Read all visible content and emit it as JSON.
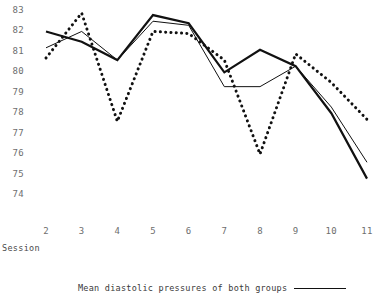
{
  "chart_data": {
    "type": "line",
    "title": "",
    "xlabel": "Session",
    "ylabel": "",
    "categories": [
      2,
      3,
      4,
      5,
      6,
      7,
      8,
      9,
      10,
      11
    ],
    "x": [
      2,
      3,
      4,
      5,
      6,
      7,
      8,
      9,
      10,
      11
    ],
    "xlim": [
      2,
      11
    ],
    "ylim": [
      74,
      83
    ],
    "yticks": [
      83,
      82,
      81,
      80,
      79,
      78,
      77,
      76,
      75,
      74
    ],
    "xticks": [
      2,
      3,
      4,
      5,
      6,
      7,
      8,
      9,
      10,
      11
    ],
    "grid": false,
    "legend_position": "bottom",
    "series": [
      {
        "name": "Mean diastolic pressures of both groups",
        "style": "solid-thick",
        "values": [
          82.0,
          81.5,
          80.6,
          82.8,
          82.4,
          80.0,
          81.1,
          80.3,
          78.0,
          74.8
        ]
      },
      {
        "name": "group-b-solid-thin",
        "style": "solid-thin",
        "values": [
          81.2,
          82.0,
          80.6,
          82.5,
          82.3,
          79.3,
          79.3,
          80.3,
          78.3,
          75.6
        ]
      },
      {
        "name": "group-c-dotted",
        "style": "dotted",
        "values": [
          80.7,
          82.9,
          77.6,
          82.0,
          81.9,
          80.6,
          76.0,
          80.9,
          79.5,
          77.7
        ]
      }
    ]
  },
  "axes": {
    "y_tick_labels": [
      "83",
      "82",
      "81",
      "80",
      "79",
      "78",
      "77",
      "76",
      "75",
      "74"
    ],
    "x_tick_labels": [
      "2",
      "3",
      "4",
      "5",
      "6",
      "7",
      "8",
      "9",
      "10",
      "11"
    ],
    "x_axis_title": "Session"
  },
  "legend": {
    "entries": [
      {
        "label": "Mean diastolic pressures of both groups",
        "style": "solid-thick"
      }
    ]
  },
  "colors": {
    "line": "#111111",
    "tick_text": "#6e6e6e",
    "label_text": "#3a3a3a",
    "background": "#ffffff"
  }
}
